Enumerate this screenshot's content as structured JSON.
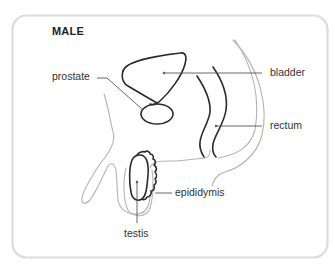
{
  "diagram": {
    "title": "MALE",
    "labels": {
      "prostate": "prostate",
      "bladder": "bladder",
      "rectum": "rectum",
      "epididymis": "epididymis",
      "testis": "testis"
    },
    "colors": {
      "card_border": "#dcdcdc",
      "organ_outline": "#2a2a2a",
      "body_outline": "#b5b5b5",
      "leader_line": "#555555",
      "text": "#333333"
    }
  }
}
